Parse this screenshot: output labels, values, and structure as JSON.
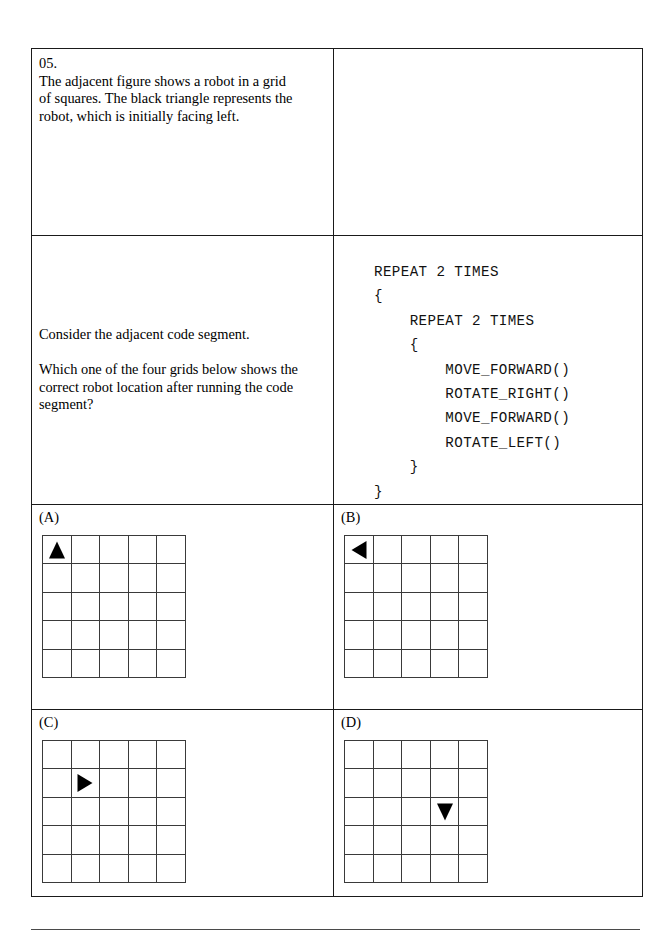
{
  "question": {
    "number": "05.",
    "intro_lines": [
      "The adjacent figure shows a robot in a grid",
      "of squares. The black triangle represents the",
      "robot, which is initially facing left."
    ],
    "prompt_1": "Consider the adjacent code segment.",
    "prompt_2": "Which one of the four grids below shows the correct robot location after running the code segment?"
  },
  "code_segment": {
    "text": "REPEAT 2 TIMES\n{\n    REPEAT 2 TIMES\n    {\n        MOVE_FORWARD()\n        ROTATE_RIGHT()\n        MOVE_FORWARD()\n        ROTATE_LEFT()\n    }\n}",
    "lines": [
      "REPEAT 2 TIMES",
      "{",
      "    REPEAT 2 TIMES",
      "    {",
      "        MOVE_FORWARD()",
      "        ROTATE_RIGHT()",
      "        MOVE_FORWARD()",
      "        ROTATE_LEFT()",
      "    }",
      "}"
    ]
  },
  "figure": {
    "grid_rows": 5,
    "grid_cols": 5,
    "robot": {
      "row": 5,
      "col": 5,
      "facing": "left"
    }
  },
  "options": [
    {
      "label": "(A)",
      "grid_rows": 5,
      "grid_cols": 5,
      "robot": {
        "row": 1,
        "col": 1,
        "facing": "up"
      }
    },
    {
      "label": "(B)",
      "grid_rows": 5,
      "grid_cols": 5,
      "robot": {
        "row": 1,
        "col": 1,
        "facing": "left"
      }
    },
    {
      "label": "(C)",
      "grid_rows": 5,
      "grid_cols": 5,
      "robot": {
        "row": 2,
        "col": 2,
        "facing": "right"
      }
    },
    {
      "label": "(D)",
      "grid_rows": 5,
      "grid_cols": 5,
      "robot": {
        "row": 3,
        "col": 4,
        "facing": "down"
      }
    }
  ],
  "colors": {
    "ink": "#000000",
    "table_border": "#1a1a1a",
    "grid_line": "#3a3a3a",
    "page_background": "#ffffff",
    "footer_rule": "#4a4a4a"
  }
}
